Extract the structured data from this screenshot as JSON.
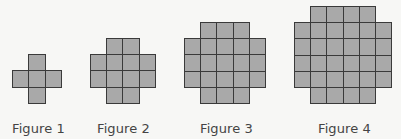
{
  "figures": [
    {
      "label": "Figure 1",
      "label_x": 12,
      "origin_x": 12,
      "origin_y": 54,
      "cell": 16.3,
      "rows": [
        "0 1 0",
        "1 1 1",
        "0 1 0"
      ]
    },
    {
      "label": "Figure 2",
      "label_x": 97,
      "origin_x": 90,
      "origin_y": 38,
      "cell": 16.2,
      "rows": [
        "0 1 1 0",
        "1 1 1 1",
        "1 1 1 1",
        "0 1 1 0"
      ]
    },
    {
      "label": "Figure 3",
      "label_x": 200,
      "origin_x": 184,
      "origin_y": 22,
      "cell": 16.2,
      "rows": [
        "0 1 1 1 0",
        "1 1 1 1 1",
        "1 1 1 1 1",
        "1 1 1 1 1",
        "0 1 1 1 0"
      ]
    },
    {
      "label": "Figure 4",
      "label_x": 318,
      "origin_x": 294,
      "origin_y": 6,
      "cell": 16.2,
      "rows": [
        "0 1 1 1 1 0",
        "1 1 1 1 1 1",
        "1 1 1 1 1 1",
        "1 1 1 1 1 1",
        "1 1 1 1 1 1",
        "0 1 1 1 1 0"
      ]
    }
  ],
  "colors": {
    "background": "#f7f7f5",
    "cell_fill": "#a9a9a9",
    "cell_border": "#3a3a3a",
    "label_text": "#444444"
  }
}
